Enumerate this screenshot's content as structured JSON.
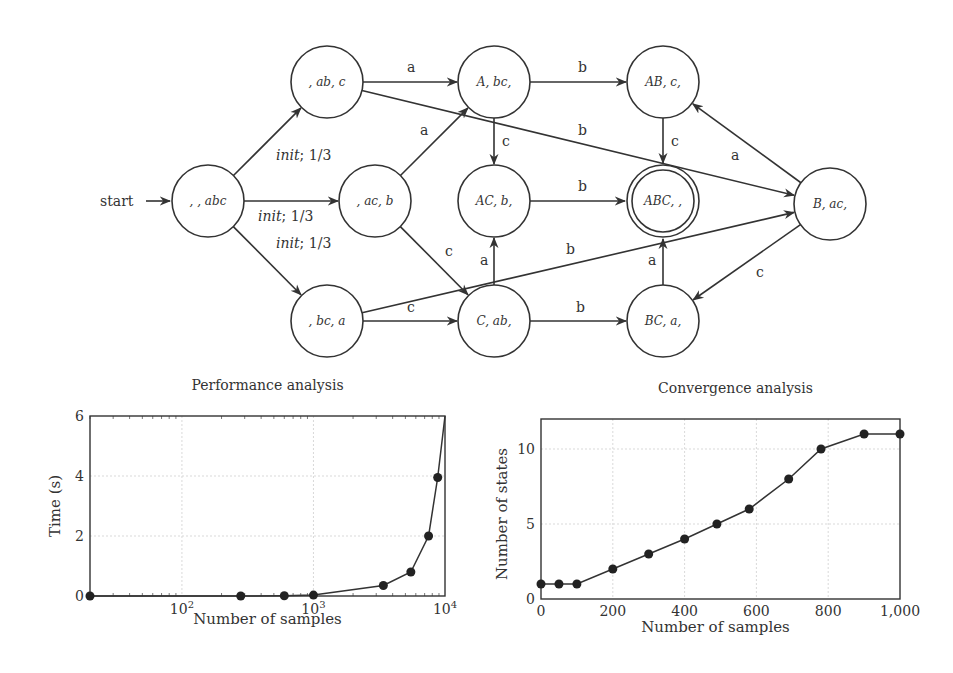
{
  "diagram": {
    "start_label": "start",
    "nodes": [
      {
        "id": "n0",
        "label": ", , abc",
        "x": 208,
        "y": 201,
        "initial": true
      },
      {
        "id": "n1",
        "label": ", ab, c",
        "x": 327,
        "y": 82
      },
      {
        "id": "n2",
        "label": ", ac, b",
        "x": 375,
        "y": 201
      },
      {
        "id": "n3",
        "label": ", bc, a",
        "x": 327,
        "y": 321
      },
      {
        "id": "n4",
        "label": "A, bc,",
        "x": 494,
        "y": 82
      },
      {
        "id": "n5",
        "label": "AC, b,",
        "x": 494,
        "y": 201
      },
      {
        "id": "n6",
        "label": "C, ab,",
        "x": 494,
        "y": 321
      },
      {
        "id": "n7",
        "label": "AB, c,",
        "x": 663,
        "y": 82
      },
      {
        "id": "n8",
        "label": "ABC, ,",
        "x": 663,
        "y": 201,
        "accepting": true
      },
      {
        "id": "n9",
        "label": "BC, a,",
        "x": 663,
        "y": 321
      },
      {
        "id": "n10",
        "label": "B, ac,",
        "x": 830,
        "y": 204
      }
    ],
    "edges": [
      {
        "from": "n0",
        "to": "n1",
        "label": "init; 1/3"
      },
      {
        "from": "n0",
        "to": "n2",
        "label": "init; 1/3"
      },
      {
        "from": "n0",
        "to": "n3",
        "label": "init; 1/3"
      },
      {
        "from": "n1",
        "to": "n4",
        "label": "a"
      },
      {
        "from": "n1",
        "to": "n10",
        "label": "b"
      },
      {
        "from": "n2",
        "to": "n4",
        "label": "a"
      },
      {
        "from": "n2",
        "to": "n6",
        "label": "c"
      },
      {
        "from": "n3",
        "to": "n6",
        "label": "c"
      },
      {
        "from": "n3",
        "to": "n10",
        "label": "b"
      },
      {
        "from": "n4",
        "to": "n7",
        "label": "b"
      },
      {
        "from": "n4",
        "to": "n5",
        "label": "c"
      },
      {
        "from": "n5",
        "to": "n8",
        "label": "b"
      },
      {
        "from": "n6",
        "to": "n5",
        "label": "a"
      },
      {
        "from": "n6",
        "to": "n9",
        "label": "b"
      },
      {
        "from": "n7",
        "to": "n8",
        "label": "c"
      },
      {
        "from": "n9",
        "to": "n8",
        "label": "a"
      },
      {
        "from": "n10",
        "to": "n7",
        "label": "a"
      },
      {
        "from": "n10",
        "to": "n9",
        "label": "c"
      }
    ]
  },
  "chart_data": [
    {
      "type": "line",
      "title": "Performance analysis",
      "xlabel": "Number of samples",
      "ylabel": "Time (s)",
      "xscale": "log",
      "xlim": [
        20,
        10000
      ],
      "ylim": [
        0,
        6
      ],
      "xticks": [
        "10^2",
        "10^3",
        "10^4"
      ],
      "yticks": [
        0,
        2,
        4,
        6
      ],
      "grid": true,
      "x": [
        20,
        280,
        600,
        1000,
        3400,
        5500,
        7500,
        8800,
        10000
      ],
      "y": [
        0.0,
        0.0,
        0.01,
        0.03,
        0.35,
        0.8,
        2.0,
        3.95,
        6.0
      ],
      "markers": [
        true,
        true,
        true,
        true,
        true,
        true,
        true,
        true,
        false
      ]
    },
    {
      "type": "line",
      "title": "Convergence analysis",
      "xlabel": "Number of samples",
      "ylabel": "Number of states",
      "xlim": [
        0,
        1000
      ],
      "ylim": [
        0,
        12
      ],
      "xticks": [
        "0",
        "200",
        "400",
        "600",
        "800",
        "1,000"
      ],
      "yticks": [
        0,
        5,
        10
      ],
      "grid": true,
      "x": [
        0,
        50,
        100,
        200,
        300,
        400,
        490,
        580,
        690,
        780,
        900,
        1000
      ],
      "y": [
        1,
        1,
        1,
        2,
        3,
        4,
        5,
        6,
        8,
        10,
        11,
        11
      ]
    }
  ]
}
